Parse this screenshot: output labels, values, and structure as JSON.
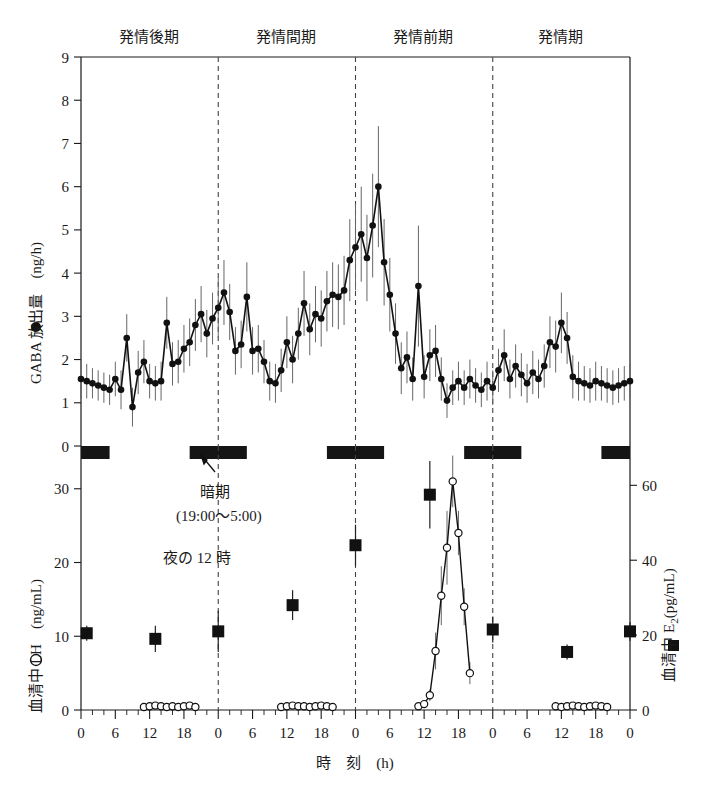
{
  "figure": {
    "xlabel": "時　刻　(h)",
    "phases": [
      "発情後期",
      "発情間期",
      "発情前期",
      "発情期"
    ],
    "annotations": {
      "dark_phase_line1": "暗期",
      "dark_phase_line2": "(19:00〜5:00)",
      "midnight": "夜の 12 時"
    },
    "axes": {
      "gaba_title_marker": "●",
      "gaba_title": "GABA 放出量　(ng/h)",
      "lh_title_marker": "○",
      "lh_title": "血清中 LH　(ng/mL)",
      "e2_title_marker": "■",
      "e2_title": "血清中 E",
      "e2_title_sub": "2",
      "e2_title_unit": "(pg/mL)"
    },
    "x_ticks": [
      "0",
      "6",
      "12",
      "18",
      "0",
      "6",
      "12",
      "18",
      "0",
      "6",
      "12",
      "18",
      "0",
      "6",
      "12",
      "18",
      "0"
    ],
    "gaba_ticks": [
      "0",
      "1",
      "2",
      "3",
      "4",
      "5",
      "6",
      "7",
      "8",
      "9"
    ],
    "lh_ticks": [
      "0",
      "10",
      "20",
      "30"
    ],
    "e2_ticks": [
      "0",
      "20",
      "40",
      "60"
    ]
  },
  "chart_data": [
    {
      "type": "line",
      "name": "GABA release",
      "title": "GABA 放出量",
      "xlabel": "時刻 (h)",
      "ylabel": "GABA 放出量 (ng/h)",
      "ylim": [
        0,
        9
      ],
      "xlim": [
        0,
        96
      ],
      "marker": "filled-circle",
      "errorbars": true,
      "x": [
        0,
        1,
        2,
        3,
        4,
        5,
        6,
        7,
        8,
        9,
        10,
        11,
        12,
        13,
        14,
        15,
        16,
        17,
        18,
        19,
        20,
        21,
        22,
        23,
        24,
        25,
        26,
        27,
        28,
        29,
        30,
        31,
        32,
        33,
        34,
        35,
        36,
        37,
        38,
        39,
        40,
        41,
        42,
        43,
        44,
        45,
        46,
        47,
        48,
        49,
        50,
        51,
        52,
        53,
        54,
        55,
        56,
        57,
        58,
        59,
        60,
        61,
        62,
        63,
        64,
        65,
        66,
        67,
        68,
        69,
        70,
        71,
        72,
        73,
        74,
        75,
        76,
        77,
        78,
        79,
        80,
        81,
        82,
        83,
        84,
        85,
        86,
        87,
        88,
        89,
        90,
        91,
        92,
        93,
        94,
        95,
        96
      ],
      "y": [
        1.55,
        1.5,
        1.45,
        1.4,
        1.35,
        1.3,
        1.55,
        1.3,
        2.5,
        0.9,
        1.7,
        1.95,
        1.5,
        1.45,
        1.5,
        2.85,
        1.9,
        1.95,
        2.25,
        2.4,
        2.8,
        3.05,
        2.6,
        2.95,
        3.2,
        3.55,
        3.1,
        2.2,
        2.35,
        3.45,
        2.2,
        2.25,
        1.95,
        1.5,
        1.45,
        1.75,
        2.4,
        2.0,
        2.6,
        3.3,
        2.7,
        3.05,
        2.95,
        3.35,
        3.5,
        3.45,
        3.6,
        4.3,
        4.6,
        4.9,
        4.35,
        5.1,
        6.0,
        4.25,
        3.5,
        2.6,
        1.8,
        2.05,
        1.55,
        3.7,
        1.6,
        2.1,
        2.2,
        1.55,
        1.05,
        1.35,
        1.5,
        1.35,
        1.55,
        1.4,
        1.3,
        1.5,
        1.35,
        1.75,
        2.1,
        1.55,
        1.85,
        1.65,
        1.45,
        1.7,
        1.55,
        1.85,
        2.4,
        2.3,
        2.85,
        2.5,
        1.6,
        1.5,
        1.45,
        1.4,
        1.5,
        1.45,
        1.4,
        1.35,
        1.4,
        1.45,
        1.5
      ],
      "yerr": [
        0.45,
        0.4,
        0.35,
        0.35,
        0.35,
        0.35,
        0.4,
        0.45,
        0.55,
        0.45,
        0.5,
        0.5,
        0.4,
        0.4,
        0.45,
        0.6,
        0.5,
        0.5,
        0.55,
        0.55,
        0.6,
        0.65,
        0.55,
        0.6,
        0.7,
        0.75,
        0.65,
        0.55,
        0.55,
        0.8,
        0.55,
        0.55,
        0.5,
        0.45,
        0.45,
        0.5,
        0.6,
        0.55,
        0.6,
        0.75,
        0.6,
        0.65,
        0.65,
        0.7,
        0.75,
        0.75,
        0.8,
        0.95,
        1.0,
        1.1,
        1.0,
        1.2,
        1.4,
        1.0,
        0.85,
        0.7,
        0.6,
        0.6,
        0.5,
        1.4,
        0.5,
        0.6,
        0.6,
        0.5,
        0.4,
        0.4,
        0.45,
        0.4,
        0.45,
        0.4,
        0.4,
        0.45,
        0.4,
        0.5,
        0.6,
        0.45,
        0.5,
        0.5,
        0.45,
        0.5,
        0.45,
        0.5,
        0.6,
        0.6,
        0.7,
        0.6,
        0.5,
        0.45,
        0.4,
        0.4,
        0.45,
        0.4,
        0.4,
        0.4,
        0.4,
        0.4,
        0.4
      ]
    },
    {
      "type": "line",
      "name": "Serum LH",
      "ylabel": "血清中 LH (ng/mL)",
      "ylim": [
        0,
        35
      ],
      "marker": "open-circle",
      "errorbars": true,
      "x": [
        11,
        12,
        13,
        14,
        15,
        16,
        17,
        18,
        19,
        20,
        35,
        36,
        37,
        38,
        39,
        40,
        41,
        42,
        43,
        44,
        59,
        60,
        61,
        62,
        63,
        64,
        65,
        66,
        67,
        68,
        83,
        84,
        85,
        86,
        87,
        88,
        89,
        90,
        91,
        92
      ],
      "y": [
        0.4,
        0.5,
        0.6,
        0.5,
        0.4,
        0.5,
        0.4,
        0.5,
        0.6,
        0.4,
        0.4,
        0.5,
        0.6,
        0.5,
        0.5,
        0.4,
        0.5,
        0.6,
        0.5,
        0.4,
        0.5,
        0.8,
        2.0,
        8.0,
        15.5,
        22.0,
        31.0,
        24.0,
        14.0,
        5.0,
        0.5,
        0.4,
        0.5,
        0.6,
        0.5,
        0.4,
        0.5,
        0.6,
        0.5,
        0.4
      ],
      "yerr": [
        0.2,
        0.2,
        0.2,
        0.2,
        0.2,
        0.2,
        0.2,
        0.2,
        0.2,
        0.2,
        0.2,
        0.2,
        0.2,
        0.2,
        0.2,
        0.2,
        0.2,
        0.2,
        0.2,
        0.2,
        0.2,
        0.3,
        0.8,
        2.5,
        4.0,
        5.0,
        3.5,
        3.0,
        2.5,
        1.5,
        0.2,
        0.2,
        0.2,
        0.2,
        0.2,
        0.2,
        0.2,
        0.2,
        0.2,
        0.2
      ],
      "peak_value": 31.0,
      "peak_time": 65
    },
    {
      "type": "scatter",
      "name": "Serum E2",
      "ylabel": "血清中 E2 (pg/mL)",
      "ylim": [
        0,
        70
      ],
      "marker": "filled-square",
      "errorbars": true,
      "x": [
        1,
        13,
        24,
        37,
        48,
        61,
        72,
        85,
        96
      ],
      "y": [
        20.5,
        19.0,
        21.0,
        28.0,
        44.0,
        57.5,
        21.5,
        15.5,
        21.0
      ],
      "yerr": [
        2.0,
        3.5,
        5.5,
        4.0,
        5.5,
        9.0,
        3.5,
        2.0,
        2.5
      ]
    }
  ],
  "dark_bars": [
    {
      "start": 0,
      "end": 5
    },
    {
      "start": 19,
      "end": 29
    },
    {
      "start": 43,
      "end": 53
    },
    {
      "start": 67,
      "end": 77
    },
    {
      "start": 91,
      "end": 96
    }
  ],
  "dividers": [
    24,
    48,
    72
  ],
  "phase_centers": [
    12,
    36,
    60,
    84
  ]
}
